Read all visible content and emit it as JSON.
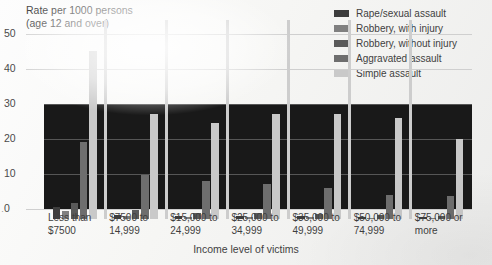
{
  "axis": {
    "y_title_line1": "Rate per 1000 persons",
    "y_title_line2": "(age 12 and over)",
    "x_title": "Income level of victims",
    "y_ticks": [
      "50",
      "40",
      "30",
      "20",
      "10",
      "0"
    ]
  },
  "legend": {
    "items": [
      {
        "label": "Rape/sexual assault",
        "color": "#3d3d3d"
      },
      {
        "label": "Robbery, with injury",
        "color": "#808080"
      },
      {
        "label": "Robbery, without injury",
        "color": "#5a5a5a"
      },
      {
        "label": "Aggravated assault",
        "color": "#6e6e6e"
      },
      {
        "label": "Simple assault",
        "color": "#c9c9c9"
      }
    ]
  },
  "chart_data": {
    "type": "bar",
    "title": "",
    "xlabel": "Income level of victims",
    "ylabel": "Rate per 1000 persons (age 12 and over)",
    "ylim": [
      0,
      50
    ],
    "yticks": [
      0,
      10,
      20,
      30,
      40,
      50
    ],
    "grid": true,
    "legend_position": "top-right",
    "categories": [
      "Less than $7500",
      "$7500 to 14,999",
      "$15,000 to 24,999",
      "$25,000 to 34,999",
      "$35,000 to 49,999",
      "$50,000 to 74,999",
      "$75,000 or more"
    ],
    "category_lines": [
      [
        "Less than",
        "$7500"
      ],
      [
        "$7500 to",
        "14,999"
      ],
      [
        "$15,000 to",
        "24,999"
      ],
      [
        "$25,000 to",
        "34,999"
      ],
      [
        "$35,000 to",
        "49,999"
      ],
      [
        "$50,000 to",
        "74,999"
      ],
      [
        "$75,000 or",
        "more"
      ]
    ],
    "series": [
      {
        "name": "Rape/sexual assault",
        "color": "#3d3d3d",
        "values": [
          3.5,
          1.2,
          1.0,
          1.0,
          0.8,
          0.5,
          0.5
        ]
      },
      {
        "name": "Robbery, with injury",
        "color": "#808080",
        "values": [
          2.2,
          0.8,
          0.6,
          0.6,
          0.5,
          0.4,
          0.3
        ]
      },
      {
        "name": "Robbery, without injury",
        "color": "#5a5a5a",
        "values": [
          4.5,
          2.6,
          1.8,
          1.6,
          1.4,
          1.2,
          1.0
        ]
      },
      {
        "name": "Aggravated assault",
        "color": "#6e6e6e",
        "values": [
          22.0,
          12.5,
          11.0,
          10.0,
          9.0,
          7.0,
          6.5
        ]
      },
      {
        "name": "Simple assault",
        "color": "#c9c9c9",
        "values": [
          48.0,
          30.0,
          27.5,
          30.0,
          30.0,
          29.0,
          23.0
        ]
      }
    ]
  }
}
